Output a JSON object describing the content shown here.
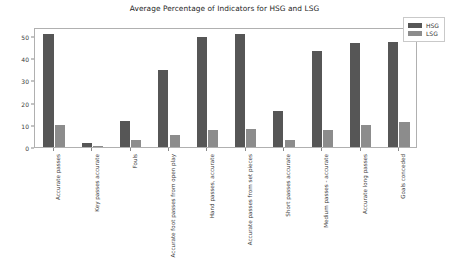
{
  "chart_data": {
    "type": "bar",
    "title": "Average Percentage of Indicators for HSG and LSG",
    "xlabel": "",
    "ylabel": "",
    "ylim": [
      0,
      54
    ],
    "yticks": [
      0,
      10,
      20,
      30,
      40,
      50
    ],
    "grid": false,
    "legend_position": "upper right",
    "categories": [
      "Accurate passes",
      "Key passes accurate",
      "Fouls",
      "Accurate foot passes from open play",
      "Hand passes, accurate",
      "Accurate passes from set pieces",
      "Short passes accurate",
      "Medium passes - accurate",
      "Accurate long passes",
      "Goals conceded"
    ],
    "series": [
      {
        "name": "HSG",
        "color": "#565656",
        "values": [
          50.7,
          2.0,
          11.7,
          34.8,
          49.3,
          51.0,
          16.2,
          43.2,
          46.8,
          47.2
        ]
      },
      {
        "name": "LSG",
        "color": "#8c8c8c",
        "values": [
          9.8,
          0.4,
          3.3,
          5.5,
          7.8,
          8.1,
          3.2,
          7.8,
          9.7,
          11.3
        ]
      }
    ]
  },
  "legend": {
    "entries": [
      {
        "label": "HSG"
      },
      {
        "label": "LSG"
      }
    ]
  }
}
